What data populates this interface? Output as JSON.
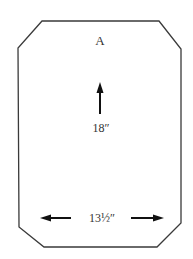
{
  "pattern_piece": {
    "label": "A",
    "shape": "rectangle-with-clipped-corners",
    "outline_color": "#3a3a3a",
    "height_dimension": "18″",
    "width_dimension": "13½″"
  },
  "icons": {
    "height_arrow": "arrow-up-icon",
    "width_arrow_left": "arrow-left-icon",
    "width_arrow_right": "arrow-right-icon"
  },
  "colors": {
    "background": "#ffffff",
    "outline": "#3a3a3a",
    "arrow": "#111111",
    "text": "#333333"
  }
}
